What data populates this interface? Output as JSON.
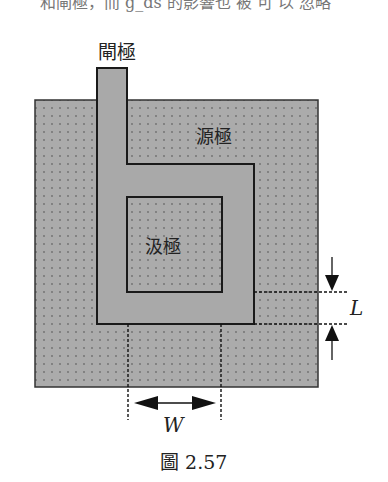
{
  "top_text": "和閘極，而 g_ds 的影響也 被 可 以 忽略",
  "diagram": {
    "labels": {
      "gate": "閘極",
      "source": "源極",
      "drain": "汲極",
      "length": "L",
      "width": "W"
    },
    "colors": {
      "fill": "#aaaaaa",
      "dot": "#707070",
      "line": "#1a1a1a"
    }
  },
  "caption": "圖 2.57"
}
